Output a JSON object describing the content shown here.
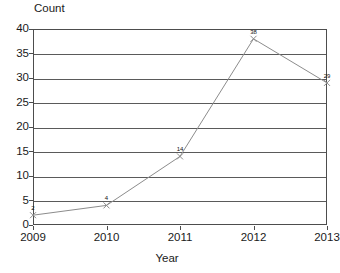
{
  "chart_data": {
    "type": "line",
    "title": "",
    "xlabel": "Year",
    "ylabel": "Count",
    "categories": [
      "2009",
      "2010",
      "2011",
      "2012",
      "2013"
    ],
    "values": [
      2,
      4,
      14,
      38,
      29
    ],
    "point_labels": [
      "2",
      "4",
      "14",
      "38",
      "29"
    ],
    "ylim": [
      0,
      40
    ],
    "yticks": [
      "0",
      "5",
      "10",
      "15",
      "20",
      "25",
      "30",
      "35",
      "40"
    ],
    "ytick_values": [
      0,
      5,
      10,
      15,
      20,
      25,
      30,
      35,
      40
    ],
    "grid": true,
    "legend": false,
    "legend_position": "none",
    "series": [
      {
        "name": "Count",
        "values": [
          2,
          4,
          14,
          38,
          29
        ],
        "marker": "x",
        "line_color": "#8c8c8c",
        "marker_color": "#8c8c8c"
      }
    ],
    "colors": {
      "line": "#8c8c8c",
      "marker": "#8c8c8c",
      "grid": "#5a5a5a",
      "frame": "#4d4d4d",
      "text": "#1a1a1a",
      "background": "#ffffff"
    }
  }
}
